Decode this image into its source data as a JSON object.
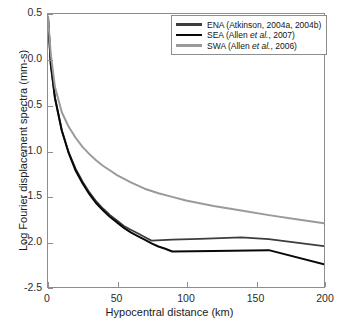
{
  "chart_data": {
    "type": "line",
    "title": "",
    "xlabel": "Hypocentral distance (km)",
    "ylabel": "Log Fourier displacement spectra (mm-s)",
    "xlim": [
      0,
      200
    ],
    "ylim": [
      -2.5,
      0.5
    ],
    "xticks": [
      0,
      50,
      100,
      150,
      200
    ],
    "yticks": [
      0.5,
      0.0,
      -0.5,
      -1.0,
      -1.5,
      -2.0,
      -2.5
    ],
    "xtick_labels": [
      "0",
      "50",
      "100",
      "150",
      "200"
    ],
    "ytick_labels": [
      "0.5",
      "0.0",
      "-0.5",
      "-1.0",
      "-1.5",
      "-2.0",
      "-2.5"
    ],
    "grid": false,
    "legend_position": "top-right",
    "series": [
      {
        "name": "ENA (Atkinson, 2004a, 2004b)",
        "label_prefix": "ENA (Atkinson, 2004a, 2004b)",
        "color": "#3d3d3d",
        "width": 1.8,
        "x": [
          0,
          2,
          5,
          10,
          15,
          20,
          25,
          30,
          35,
          40,
          45,
          50,
          55,
          60,
          65,
          70,
          75,
          90,
          110,
          140,
          160,
          200
        ],
        "y": [
          0.47,
          -0.05,
          -0.42,
          -0.78,
          -1.02,
          -1.2,
          -1.34,
          -1.46,
          -1.56,
          -1.64,
          -1.71,
          -1.77,
          -1.83,
          -1.87,
          -1.91,
          -1.95,
          -1.99,
          -1.98,
          -1.97,
          -1.955,
          -1.975,
          -2.05
        ]
      },
      {
        "name": "SEA (Allen et al., 2007)",
        "label_prefix": "SEA (Allen ",
        "label_italic": "et al.",
        "label_suffix": ", 2007)",
        "color": "#080808",
        "width": 2.0,
        "x": [
          0,
          2,
          5,
          10,
          15,
          20,
          25,
          30,
          35,
          40,
          45,
          50,
          55,
          60,
          65,
          70,
          75,
          80,
          85,
          90,
          120,
          160,
          200
        ],
        "y": [
          0.47,
          -0.05,
          -0.42,
          -0.78,
          -1.03,
          -1.22,
          -1.36,
          -1.48,
          -1.58,
          -1.66,
          -1.73,
          -1.79,
          -1.85,
          -1.9,
          -1.94,
          -1.98,
          -2.02,
          -2.055,
          -2.08,
          -2.11,
          -2.105,
          -2.095,
          -2.25
        ]
      },
      {
        "name": "SWA (Allen et al., 2006)",
        "label_prefix": "SWA (Allen ",
        "label_italic": "et al.",
        "label_suffix": ", 2006)",
        "color": "#9a9a9a",
        "width": 2.0,
        "x": [
          0,
          2,
          5,
          10,
          15,
          20,
          25,
          30,
          35,
          40,
          45,
          50,
          60,
          70,
          80,
          90,
          100,
          120,
          140,
          160,
          180,
          200
        ],
        "y": [
          0.47,
          0.06,
          -0.3,
          -0.58,
          -0.74,
          -0.86,
          -0.96,
          -1.04,
          -1.11,
          -1.17,
          -1.22,
          -1.27,
          -1.35,
          -1.42,
          -1.47,
          -1.51,
          -1.55,
          -1.61,
          -1.66,
          -1.71,
          -1.755,
          -1.8
        ]
      }
    ]
  },
  "legend": {
    "items": [
      {
        "text": "ENA (Atkinson, 2004a, 2004b)",
        "color": "#3d3d3d"
      },
      {
        "text": "SEA (Allen et al., 2007)",
        "color": "#080808"
      },
      {
        "text": "SWA (Allen et al., 2006)",
        "color": "#9a9a9a"
      }
    ]
  },
  "axes": {
    "x_title": "Hypocentral distance (km)",
    "y_title": "Log Fourier displacement spectra (mm-s)"
  }
}
